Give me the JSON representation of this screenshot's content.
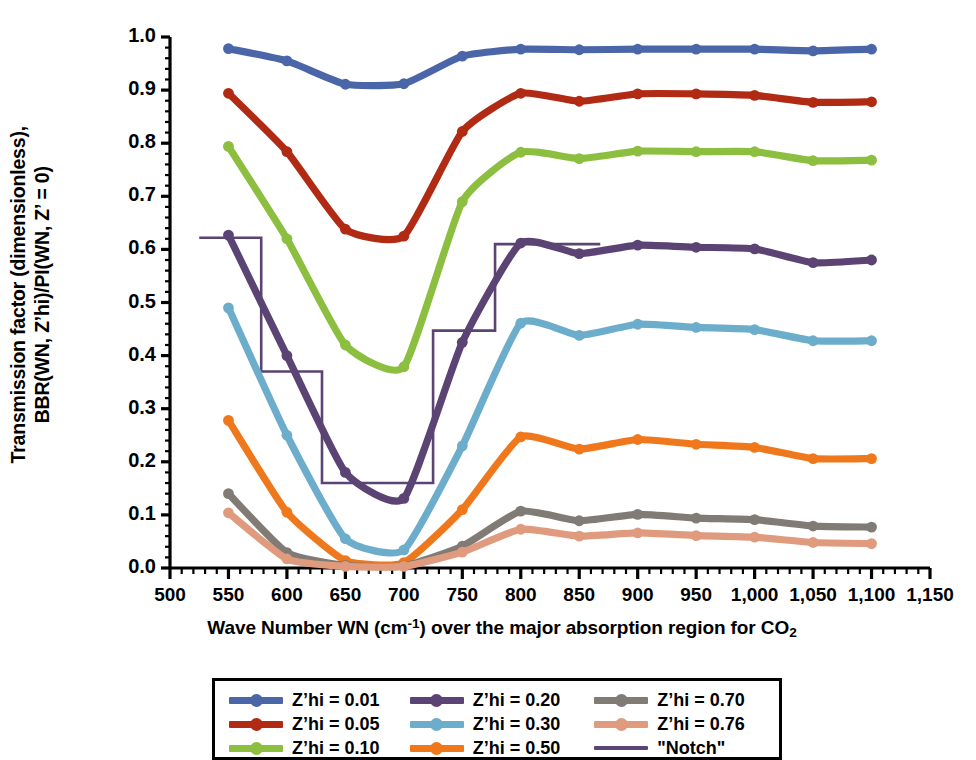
{
  "chart_data": {
    "type": "line",
    "title": "",
    "xlabel": "Wave Number WN (cm⁻¹) over the major absorption region for CO₂",
    "ylabel_line1": "Transmission factor (dimensionless),",
    "ylabel_line2": "BBR(WN, Z’hi)/PI(WN, Z’ = 0)",
    "xlim": [
      500,
      1150
    ],
    "ylim": [
      0.0,
      1.0
    ],
    "grid": false,
    "legend_position": "below-center",
    "xticks": [
      "500",
      "550",
      "600",
      "650",
      "700",
      "750",
      "800",
      "850",
      "900",
      "950",
      "1,000",
      "1,050",
      "1,100",
      "1,150"
    ],
    "xtick_values": [
      500,
      550,
      600,
      650,
      700,
      750,
      800,
      850,
      900,
      950,
      1000,
      1050,
      1100,
      1150
    ],
    "yticks": [
      "0.0",
      "0.1",
      "0.2",
      "0.3",
      "0.4",
      "0.5",
      "0.6",
      "0.7",
      "0.8",
      "0.9",
      "1.0"
    ],
    "ytick_values": [
      0.0,
      0.1,
      0.2,
      0.3,
      0.4,
      0.5,
      0.6,
      0.7,
      0.8,
      0.9,
      1.0
    ],
    "x": [
      550,
      600,
      650,
      700,
      750,
      800,
      850,
      900,
      950,
      1000,
      1050,
      1100
    ],
    "series": [
      {
        "name": "Z’hi = 0.01",
        "color": "#4A66A8",
        "values": [
          0.978,
          0.955,
          0.911,
          0.912,
          0.964,
          0.977,
          0.976,
          0.977,
          0.977,
          0.977,
          0.974,
          0.977
        ]
      },
      {
        "name": "Z’hi = 0.05",
        "color": "#B12A14",
        "values": [
          0.894,
          0.784,
          0.638,
          0.625,
          0.822,
          0.894,
          0.879,
          0.893,
          0.893,
          0.89,
          0.877,
          0.878
        ]
      },
      {
        "name": "Z’hi = 0.10",
        "color": "#8CBE3F",
        "values": [
          0.794,
          0.62,
          0.42,
          0.379,
          0.69,
          0.783,
          0.771,
          0.785,
          0.784,
          0.784,
          0.767,
          0.768
        ]
      },
      {
        "name": "Z’hi = 0.20",
        "color": "#5B4473",
        "values": [
          0.627,
          0.4,
          0.18,
          0.131,
          0.425,
          0.612,
          0.592,
          0.608,
          0.604,
          0.601,
          0.575,
          0.58
        ]
      },
      {
        "name": "Z’hi = 0.30",
        "color": "#6DADCC",
        "values": [
          0.49,
          0.25,
          0.055,
          0.034,
          0.23,
          0.461,
          0.438,
          0.459,
          0.453,
          0.449,
          0.428,
          0.428
        ]
      },
      {
        "name": "Z’hi = 0.50",
        "color": "#F0781C",
        "values": [
          0.278,
          0.105,
          0.014,
          0.01,
          0.11,
          0.247,
          0.224,
          0.242,
          0.233,
          0.227,
          0.206,
          0.206
        ]
      },
      {
        "name": "Z’hi = 0.70",
        "color": "#807B74",
        "values": [
          0.14,
          0.029,
          0.005,
          0.004,
          0.041,
          0.107,
          0.089,
          0.101,
          0.094,
          0.091,
          0.079,
          0.077
        ]
      },
      {
        "name": "Z’hi = 0.76",
        "color": "#E09B7E",
        "values": [
          0.104,
          0.017,
          0.003,
          0.003,
          0.03,
          0.073,
          0.06,
          0.066,
          0.061,
          0.058,
          0.048,
          0.046
        ]
      }
    ],
    "notch": {
      "name": "\"Notch\"",
      "color": "#5B4473",
      "style": "step",
      "points": [
        {
          "x": 525,
          "y": 0.622
        },
        {
          "x": 578,
          "y": 0.622
        },
        {
          "x": 578,
          "y": 0.37
        },
        {
          "x": 630,
          "y": 0.37
        },
        {
          "x": 630,
          "y": 0.16
        },
        {
          "x": 725,
          "y": 0.16
        },
        {
          "x": 725,
          "y": 0.447
        },
        {
          "x": 778,
          "y": 0.447
        },
        {
          "x": 778,
          "y": 0.61
        },
        {
          "x": 868,
          "y": 0.61
        }
      ]
    }
  },
  "legend": {
    "columns": [
      [
        {
          "label": "Z’hi = 0.01",
          "color": "#4A66A8",
          "marker": true
        },
        {
          "label": "Z’hi = 0.05",
          "color": "#B12A14",
          "marker": true
        },
        {
          "label": "Z’hi = 0.10",
          "color": "#8CBE3F",
          "marker": true
        }
      ],
      [
        {
          "label": "Z’hi = 0.20",
          "color": "#5B4473",
          "marker": true
        },
        {
          "label": "Z’hi = 0.30",
          "color": "#6DADCC",
          "marker": true
        },
        {
          "label": "Z’hi = 0.50",
          "color": "#F0781C",
          "marker": true
        }
      ],
      [
        {
          "label": "Z’hi = 0.70",
          "color": "#807B74",
          "marker": true
        },
        {
          "label": "Z’hi = 0.76",
          "color": "#E09B7E",
          "marker": true
        },
        {
          "label": "\"Notch\"",
          "color": "#5B4473",
          "marker": false
        }
      ]
    ]
  }
}
